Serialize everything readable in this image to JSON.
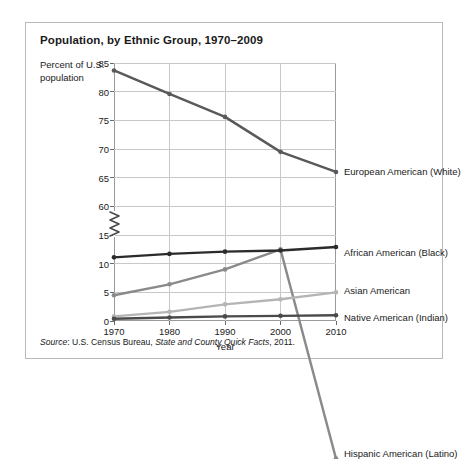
{
  "chart_data": {
    "type": "line",
    "title": "Population, by Ethnic Group, 1970–2009",
    "xlabel": "Year",
    "ylabel": "Percent of U.S. population",
    "x": [
      1970,
      1980,
      1990,
      2000,
      2010
    ],
    "xticklabels": [
      "1970",
      "1980",
      "1990",
      "2000",
      "2010"
    ],
    "yticklabels": [
      "0",
      "5",
      "10",
      "15",
      "60",
      "65",
      "70",
      "75",
      "80",
      "85"
    ],
    "ylim_lower": [
      0,
      15
    ],
    "ylim_upper": [
      60,
      85
    ],
    "axis_break": true,
    "grid": true,
    "legend_position": "right-of-plot",
    "series": [
      {
        "name": "European American (White)",
        "color": "#595959",
        "values": [
          83.7,
          79.6,
          75.6,
          69.5,
          66.0
        ]
      },
      {
        "name": "Hispanic American (Latino)",
        "color": "#8a8a8a",
        "values": [
          4.5,
          6.4,
          9.0,
          12.5,
          16.0
        ]
      },
      {
        "name": "African American (Black)",
        "color": "#2b2b2b",
        "values": [
          11.1,
          11.7,
          12.1,
          12.3,
          12.9
        ]
      },
      {
        "name": "Asian American",
        "color": "#b5b5b5",
        "values": [
          0.8,
          1.6,
          2.9,
          3.8,
          5.0
        ]
      },
      {
        "name": "Native American (Indian)",
        "color": "#4a4a4a",
        "values": [
          0.4,
          0.6,
          0.8,
          0.9,
          1.0
        ]
      }
    ],
    "source": {
      "prefix": "Source",
      "publisher": ": U.S. Census Bureau, ",
      "publication": "State and County Quick Facts",
      "suffix": ", 2011."
    }
  }
}
